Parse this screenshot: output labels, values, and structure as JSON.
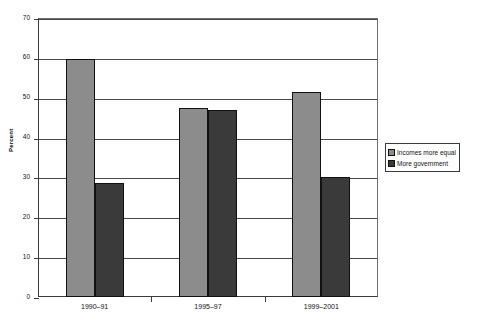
{
  "chart_data": {
    "type": "bar",
    "title": "",
    "xlabel": "",
    "ylabel": "Percent",
    "categories": [
      "1990–91",
      "1995–97",
      "1999–2001"
    ],
    "series": [
      {
        "name": "Incomes more equal",
        "color": "#8c8c8c",
        "values": [
          59.8,
          47.3,
          51.5
        ]
      },
      {
        "name": "More government",
        "color": "#3a3a3a",
        "values": [
          28.5,
          47.0,
          30.0
        ]
      }
    ],
    "ylim": [
      0,
      70
    ],
    "ytick_values": [
      0,
      10,
      20,
      30,
      40,
      50,
      60,
      70
    ],
    "ytick_labels": [
      "0",
      "10",
      "20",
      "30",
      "40",
      "50",
      "60",
      "70"
    ],
    "grid": true,
    "legend_position": "right"
  },
  "legend": {
    "entries": [
      {
        "label": "Incomes more equal",
        "color": "#8c8c8c"
      },
      {
        "label": "More government",
        "color": "#3a3a3a"
      }
    ]
  }
}
